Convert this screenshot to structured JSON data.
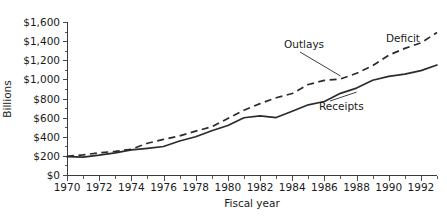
{
  "chart_data": {
    "type": "line",
    "title": "",
    "xlabel": "Fiscal year",
    "ylabel": "Billions",
    "xlim": [
      1970,
      1993
    ],
    "ylim": [
      0,
      1600
    ],
    "grid": false,
    "legend_position": "inline-annotations",
    "x_tick_labels": [
      "1970",
      "1972",
      "1974",
      "1976",
      "1978",
      "1980",
      "1982",
      "1984",
      "1986",
      "1988",
      "1990",
      "1992"
    ],
    "x_tick_values": [
      1970,
      1972,
      1974,
      1976,
      1978,
      1980,
      1982,
      1984,
      1986,
      1988,
      1990,
      1992
    ],
    "x_minor_ticks": [
      1971,
      1973,
      1975,
      1977,
      1979,
      1981,
      1983,
      1985,
      1987,
      1989,
      1991,
      1993
    ],
    "y_tick_labels": [
      "$0",
      "$200",
      "$400",
      "$600",
      "$800",
      "$1,000",
      "$1,200",
      "$1,400",
      "$1,600"
    ],
    "y_tick_values": [
      0,
      200,
      400,
      600,
      800,
      1000,
      1200,
      1400,
      1600
    ],
    "x": [
      1970,
      1971,
      1972,
      1973,
      1974,
      1975,
      1976,
      1977,
      1978,
      1979,
      1980,
      1981,
      1982,
      1983,
      1984,
      1985,
      1986,
      1987,
      1988,
      1989,
      1990,
      1991,
      1992,
      1993
    ],
    "series": [
      {
        "name": "Outlays",
        "style": "dashed",
        "values": [
          196,
          210,
          232,
          247,
          269,
          332,
          372,
          409,
          459,
          504,
          591,
          678,
          746,
          808,
          852,
          946,
          990,
          1004,
          1064,
          1143,
          1253,
          1324,
          1382,
          1490
        ]
      },
      {
        "name": "Receipts",
        "style": "solid",
        "values": [
          193,
          187,
          207,
          231,
          263,
          279,
          298,
          356,
          400,
          463,
          517,
          599,
          618,
          601,
          667,
          734,
          769,
          854,
          909,
          991,
          1032,
          1055,
          1091,
          1150
        ]
      }
    ],
    "annotations": [
      {
        "text": "Outlays",
        "series": "Outlays",
        "points_to_year": 1987
      },
      {
        "text": "Receipts",
        "series": "Receipts",
        "points_to_year": 1988
      },
      {
        "text": "Deficit",
        "description": "gap between Outlays and Receipts",
        "points_to_year": 1991
      }
    ]
  },
  "colors": {
    "line": "#2b2b2b",
    "axis": "#3a3a3a",
    "text": "#1a1a1a",
    "background": "#ffffff"
  }
}
